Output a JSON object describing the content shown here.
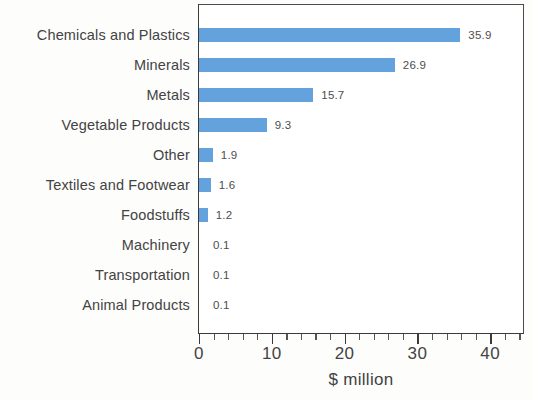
{
  "chart_data": {
    "type": "bar",
    "orientation": "horizontal",
    "title": "",
    "xlabel": "$ million",
    "ylabel": "",
    "xlim": [
      0,
      44.8
    ],
    "xticks": [
      0,
      10,
      20,
      30,
      40
    ],
    "xtick_labels": [
      "0",
      "10",
      "20",
      "30",
      "40"
    ],
    "minor_tick_step": 2,
    "grid": false,
    "legend": null,
    "bar_color": "#63a2dd",
    "categories": [
      "Chemicals and Plastics",
      "Minerals",
      "Metals",
      "Vegetable Products",
      "Other",
      "Textiles and Footwear",
      "Foodstuffs",
      "Machinery",
      "Transportation",
      "Animal Products"
    ],
    "values": [
      35.9,
      26.9,
      15.7,
      9.3,
      1.9,
      1.6,
      1.2,
      0.1,
      0.1,
      0.1
    ],
    "value_labels": [
      "35.9",
      "26.9",
      "15.7",
      "9.3",
      "1.9",
      "1.6",
      "1.2",
      "0.1",
      "0.1",
      "0.1"
    ]
  },
  "axis": {
    "x_title": "$ million"
  }
}
